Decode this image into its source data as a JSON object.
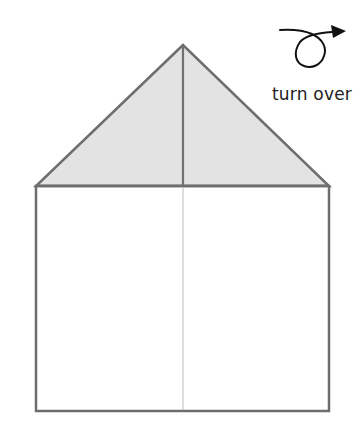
{
  "diagram": {
    "instruction": "turn over",
    "colors": {
      "fold_fill": "#e3e3e3",
      "outline": "#6e6e6e",
      "crease": "#bdbdbd",
      "center_fold_line": "#707070",
      "arrow": "#111111"
    },
    "shape": {
      "apex": [
        183,
        45
      ],
      "top_left": [
        36,
        186
      ],
      "top_right": [
        329,
        186
      ],
      "bottom_left": [
        36,
        411
      ],
      "bottom_right": [
        329,
        411
      ]
    }
  }
}
